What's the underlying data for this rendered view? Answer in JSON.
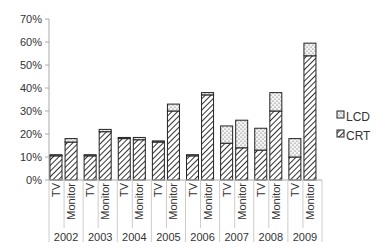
{
  "chart_data": {
    "type": "bar",
    "stacked": true,
    "title": "",
    "xlabel": "",
    "ylabel": "",
    "ylim": [
      0,
      70
    ],
    "y_ticks": [
      "0%",
      "10%",
      "20%",
      "30%",
      "40%",
      "50%",
      "60%",
      "70%"
    ],
    "grid": false,
    "legend_position": "right",
    "groups": [
      "2002",
      "2003",
      "2004",
      "2005",
      "2006",
      "2007",
      "2008",
      "2009"
    ],
    "subcategories": [
      "TV",
      "Monitor"
    ],
    "series": [
      {
        "name": "CRT",
        "pattern": "diagonal-hatch",
        "values": {
          "TV": [
            10.5,
            10.5,
            18.0,
            16.5,
            10.5,
            16.0,
            13.0,
            10.0
          ],
          "Monitor": [
            16.5,
            21.0,
            17.5,
            30.0,
            37.0,
            14.0,
            30.0,
            54.0
          ]
        }
      },
      {
        "name": "LCD",
        "pattern": "dotted",
        "values": {
          "TV": [
            0.5,
            0.5,
            0.5,
            0.5,
            0.5,
            7.5,
            9.5,
            8.0
          ],
          "Monitor": [
            1.5,
            1.0,
            1.0,
            3.0,
            1.0,
            12.0,
            8.0,
            5.5
          ]
        }
      }
    ]
  },
  "legend": {
    "items": [
      {
        "label": "LCD"
      },
      {
        "label": "CRT"
      }
    ]
  },
  "colors": {
    "axis": "#aaaaaa",
    "bar_border": "#222222",
    "hatch": "#333333",
    "dots": "#555555"
  }
}
